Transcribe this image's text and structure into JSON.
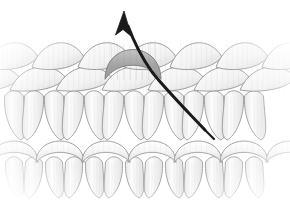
{
  "figure": {
    "title": "Knitted fabric loop structure with unraveling yarn",
    "background_color": "#ffffff",
    "width": 290,
    "height": 203
  },
  "palette": {
    "yarn_fill_light": "#fbfbfb",
    "yarn_fill_mid": "#efefef",
    "yarn_fill_shadow": "#dcdcdc",
    "yarn_outline": "#8e8e8e",
    "yarn_outline_soft": "#b4b4b4",
    "highlight_loop_fill": "#a8a8a8",
    "highlight_loop_fill_light": "#c9c9c9",
    "highlight_loop_outline": "#7a7a7a",
    "arrow_color": "#1a1a1a",
    "background": "#ffffff"
  },
  "fabric": {
    "rows": [
      {
        "id": "row-top-braid",
        "label": "Top course of interlocking loops",
        "y_center": 62,
        "loop_count": 6,
        "loop_width": 52,
        "loop_height": 34,
        "x_start": 12,
        "x_step": 46
      },
      {
        "id": "row-second-braid",
        "label": "Second course of interlocking loops",
        "y_center": 84,
        "loop_count": 6,
        "loop_width": 56,
        "loop_height": 30,
        "x_start": -8,
        "x_step": 46
      },
      {
        "id": "row-legs-upper",
        "label": "Upper row of vertical stitch legs",
        "y_top": 92,
        "y_bottom": 140,
        "leg_count": 13,
        "x_start": 14,
        "x_step": 20
      },
      {
        "id": "row-mid-domes",
        "label": "Middle course of dome loop heads",
        "y_center": 150,
        "loop_count": 6,
        "loop_width": 48,
        "loop_height": 26,
        "x_start": 14,
        "x_step": 46
      },
      {
        "id": "row-legs-lower",
        "label": "Lower row of vertical stitch legs",
        "y_top": 158,
        "y_bottom": 198,
        "leg_count": 13,
        "x_start": 14,
        "x_step": 20
      }
    ],
    "highlighted_loop": {
      "id": "highlight-loop",
      "label": "Highlighted loop being pulled",
      "center_x": 133,
      "center_y": 62,
      "width": 56,
      "height": 36,
      "fill": "#a8a8a8"
    }
  },
  "arrow": {
    "id": "pull-arrow",
    "label": "Yarn pull direction arrow",
    "color": "#1a1a1a",
    "stroke_width": 3,
    "direction": "up",
    "tip": {
      "x": 124,
      "y": 11
    },
    "tail": {
      "x": 205,
      "y": 130
    },
    "path": "M 205 130 C 188 112, 168 92, 152 72 C 142 58, 134 42, 128 26"
  },
  "annotations": {
    "caption": "",
    "legend": []
  }
}
